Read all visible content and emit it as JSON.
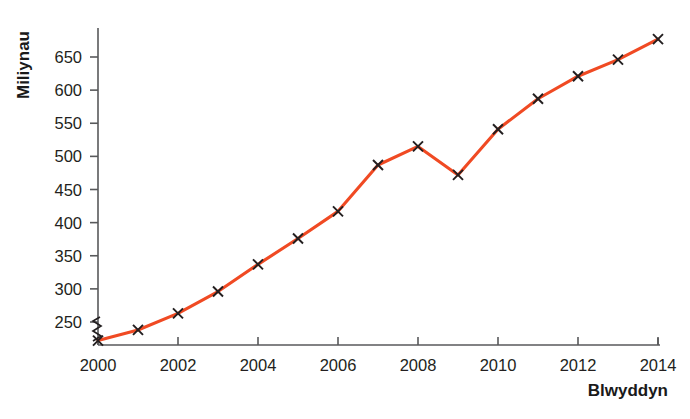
{
  "chart_data": {
    "type": "line",
    "title": "",
    "xlabel": "Blwyddyn",
    "ylabel": "Miliynau",
    "x": [
      2000,
      2001,
      2002,
      2003,
      2004,
      2005,
      2006,
      2007,
      2008,
      2009,
      2010,
      2011,
      2012,
      2013,
      2014
    ],
    "values": [
      222,
      238,
      263,
      296,
      337,
      376,
      417,
      487,
      515,
      472,
      541,
      587,
      621,
      646,
      677
    ],
    "series": [
      {
        "name": "Miliynau",
        "color": "#F04A23",
        "values": [
          222,
          238,
          263,
          296,
          337,
          376,
          417,
          487,
          515,
          472,
          541,
          587,
          621,
          646,
          677
        ]
      }
    ],
    "xtick_labels": [
      "2000",
      "2002",
      "2004",
      "2006",
      "2008",
      "2010",
      "2012",
      "2014"
    ],
    "xtick_values": [
      2000,
      2002,
      2004,
      2006,
      2008,
      2010,
      2012,
      2014
    ],
    "ytick_labels": [
      "250",
      "300",
      "350",
      "400",
      "450",
      "500",
      "550",
      "600",
      "650"
    ],
    "ytick_values": [
      250,
      300,
      350,
      400,
      450,
      500,
      550,
      600,
      650
    ],
    "xlim": [
      2000,
      2014
    ],
    "ylim": [
      218,
      690
    ],
    "grid": false,
    "legend": false,
    "marker": "x",
    "y_axis_break": true,
    "line_color": "#F04A23",
    "marker_color": "#231f20",
    "axis_color": "#58595b",
    "text_color": "#231f20"
  }
}
